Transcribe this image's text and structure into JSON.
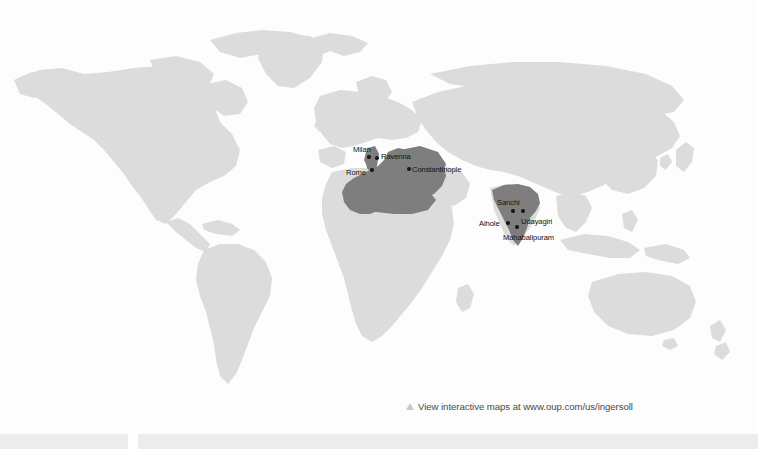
{
  "page": {
    "background_color": "#fdfdfd",
    "width": 758,
    "height": 449
  },
  "map": {
    "name": "world-map",
    "projection": "world-political-outline",
    "land_color": "#dcdcdc",
    "highlight_color": "#7e7e7e",
    "ocean_color": "#fdfdfd",
    "marker_color": "#1a1a1a",
    "label_color": "#111111",
    "highlight_regions": [
      {
        "name": "byzantine-empire-region",
        "label": ""
      },
      {
        "name": "india-region",
        "label": ""
      }
    ],
    "cities": [
      {
        "name": "Milan",
        "label_x": 353,
        "label_y": 145,
        "dot_x": 369,
        "dot_y": 157
      },
      {
        "name": "Ravenna",
        "label_x": 381,
        "label_y": 152,
        "dot_x": 377,
        "dot_y": 158
      },
      {
        "name": "Rome",
        "label_x": 346,
        "label_y": 168,
        "dot_x": 372,
        "dot_y": 170
      },
      {
        "name": "Constantinople",
        "label_x": 412,
        "label_y": 165,
        "dot_x": 409,
        "dot_y": 169
      },
      {
        "name": "Sanchi",
        "label_x": 497,
        "label_y": 198,
        "dot_x": 513,
        "dot_y": 211
      },
      {
        "name": "Udayagiri",
        "label_x": 521,
        "label_y": 217,
        "dot_x": 523,
        "dot_y": 211
      },
      {
        "name": "Aihole",
        "label_x": 479,
        "label_y": 219,
        "dot_x": 508,
        "dot_y": 223
      },
      {
        "name": "Mahabalipuram",
        "label_x": 503,
        "label_y": 233,
        "dot_x": 517,
        "dot_y": 227
      }
    ]
  },
  "caption": {
    "icon": "triangle-up-icon",
    "text": "View interactive maps at www.oup.com/us/ingersoll"
  }
}
